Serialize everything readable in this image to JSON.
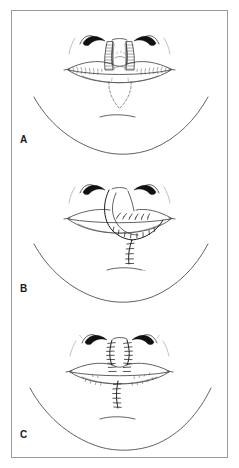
{
  "figure": {
    "border_color": "#9a9a9a",
    "background_color": "#ffffff",
    "ink_color": "#3a3a3a",
    "nostril_color": "#111111",
    "panel_count": 3
  },
  "panels": [
    {
      "label": "A",
      "caption": "Lower face with lips; shaded full-thickness lip flap outlined at the philtrum with dashed V-shaped incision marked below the lower lip",
      "elements": [
        "nose-base",
        "nostrils",
        "nasolabial-creases",
        "upper-lip",
        "lower-lip",
        "vermilion-hatching",
        "shaded-flap-left",
        "shaded-flap-right",
        "dashed-incision-v",
        "chin-crease",
        "jawline"
      ]
    },
    {
      "label": "B",
      "caption": "Flap rotated downward into the lower lip defect; interrupted sutures along the flap margins and the vertical closure line on the chin",
      "elements": [
        "nose-base",
        "nostrils",
        "upper-lip",
        "lower-lip",
        "rotated-flap",
        "flap-pedicle",
        "suture-line-flap",
        "suture-line-chin",
        "chin-crease",
        "jawline"
      ]
    },
    {
      "label": "C",
      "caption": "Completed closure; vertical suture lines run from the nasal base through the upper lip and down the chin, with the lip margins re-approximated",
      "elements": [
        "nose-base",
        "nostrils",
        "upper-lip",
        "lower-lip",
        "suture-line-upper-left",
        "suture-line-upper-right",
        "suture-line-lower",
        "vermilion-hatching",
        "chin-crease",
        "jawline"
      ]
    }
  ]
}
